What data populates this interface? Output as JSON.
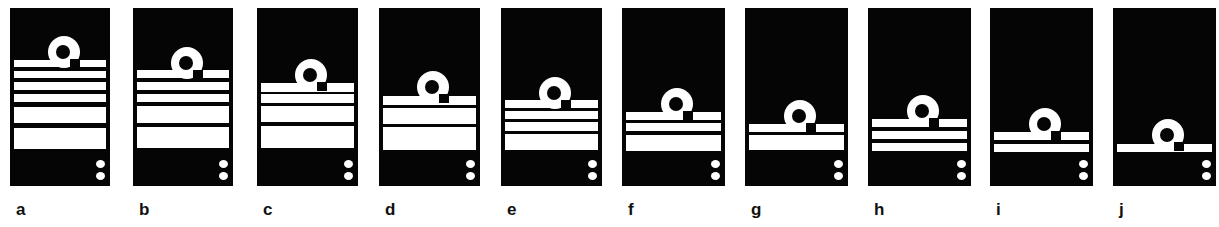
{
  "figure": {
    "colors": {
      "background": "#ffffff",
      "panel": "#050505",
      "stripe": "#ffffff"
    },
    "panels": [
      {
        "label": "a",
        "x": 10,
        "width": 100,
        "loop_top": 36,
        "stripes": [
          [
            60,
            7
          ],
          [
            71,
            7
          ],
          [
            82,
            8
          ],
          [
            94,
            8
          ],
          [
            107,
            16
          ],
          [
            128,
            21
          ]
        ]
      },
      {
        "label": "b",
        "x": 133,
        "width": 100,
        "loop_top": 47,
        "stripes": [
          [
            70,
            8
          ],
          [
            82,
            8
          ],
          [
            94,
            8
          ],
          [
            106,
            17
          ],
          [
            127,
            21
          ]
        ]
      },
      {
        "label": "c",
        "x": 257,
        "width": 101,
        "loop_top": 59,
        "stripes": [
          [
            83,
            9
          ],
          [
            94,
            9
          ],
          [
            106,
            16
          ],
          [
            126,
            22
          ]
        ]
      },
      {
        "label": "d",
        "x": 379,
        "width": 101,
        "loop_top": 71,
        "stripes": [
          [
            96,
            9
          ],
          [
            108,
            16
          ],
          [
            127,
            23
          ]
        ]
      },
      {
        "label": "e",
        "x": 501,
        "width": 101,
        "loop_top": 77,
        "stripes": [
          [
            100,
            8
          ],
          [
            111,
            8
          ],
          [
            122,
            9
          ],
          [
            134,
            16
          ]
        ]
      },
      {
        "label": "f",
        "x": 622,
        "width": 103,
        "loop_top": 88,
        "stripes": [
          [
            112,
            8
          ],
          [
            123,
            8
          ],
          [
            135,
            16
          ]
        ]
      },
      {
        "label": "g",
        "x": 745,
        "width": 103,
        "loop_top": 100,
        "stripes": [
          [
            124,
            8
          ],
          [
            135,
            15
          ]
        ]
      },
      {
        "label": "h",
        "x": 868,
        "width": 103,
        "loop_top": 95,
        "stripes": [
          [
            119,
            8
          ],
          [
            131,
            8
          ],
          [
            143,
            8
          ]
        ]
      },
      {
        "label": "i",
        "x": 990,
        "width": 103,
        "loop_top": 108,
        "stripes": [
          [
            132,
            8
          ],
          [
            144,
            8
          ]
        ]
      },
      {
        "label": "j",
        "x": 1113,
        "width": 103,
        "loop_top": 119,
        "stripes": [
          [
            144,
            8
          ]
        ]
      }
    ]
  }
}
